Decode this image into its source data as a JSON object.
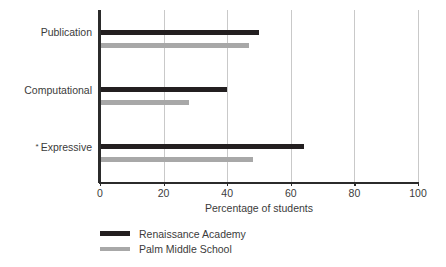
{
  "chart_data": {
    "type": "bar",
    "orientation": "horizontal",
    "title": "",
    "xlabel": "Percentage of students",
    "ylabel": "",
    "xlim": [
      0,
      100
    ],
    "xticks": [
      0,
      20,
      40,
      60,
      80,
      100
    ],
    "xtick_labels": [
      "0",
      "20",
      "40",
      "60",
      "80",
      "100"
    ],
    "grid": "vertical",
    "categories": [
      "Publication",
      "Computational",
      "Expressive"
    ],
    "category_markers": [
      "",
      "",
      "*"
    ],
    "series": [
      {
        "name": "Renaissance Academy",
        "color": "#231f20",
        "values": [
          50,
          40,
          64
        ]
      },
      {
        "name": "Palm Middle School",
        "color": "#a8a8a8",
        "values": [
          47,
          28,
          48
        ]
      }
    ],
    "legend_position": "bottom-left"
  },
  "axis": {
    "title": "Percentage of students"
  },
  "legend": {
    "items": [
      {
        "label": "Renaissance Academy"
      },
      {
        "label": "Palm Middle School"
      }
    ]
  },
  "colors": {
    "series_dark": "#231f20",
    "series_light": "#a8a8a8",
    "axis": "#2b2b2b",
    "gridline": "#c9c9c9",
    "text": "#3b3b3b",
    "background": "#ffffff"
  }
}
